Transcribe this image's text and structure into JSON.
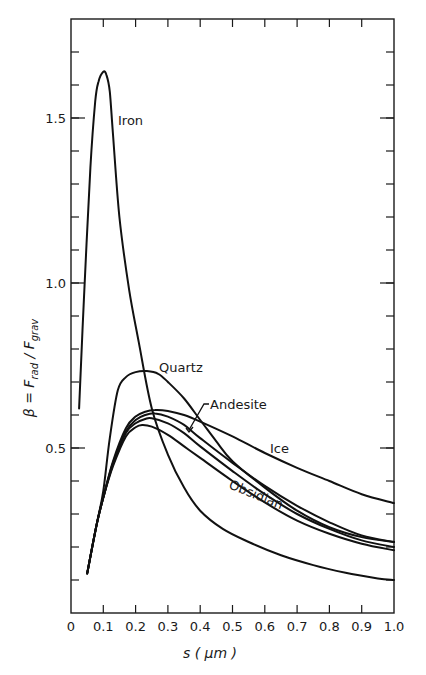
{
  "chart_data": {
    "type": "line",
    "title": "",
    "xlabel": "s (μm)",
    "ylabel": "β = F_rad / F_grav",
    "xlim": [
      0,
      1.0
    ],
    "ylim": [
      0,
      1.8
    ],
    "grid": false,
    "legend": "inline labels",
    "x_ticks": [
      "0",
      "0.1",
      "0.2",
      "0.3",
      "0.4",
      "0.5",
      "0.6",
      "0.7",
      "0.8",
      "0.9",
      "1.0"
    ],
    "y_ticks": [
      {
        "value": 0.1,
        "label": ""
      },
      {
        "value": 0.2,
        "label": ""
      },
      {
        "value": 0.3,
        "label": ""
      },
      {
        "value": 0.4,
        "label": ""
      },
      {
        "value": 0.5,
        "label": "0.5"
      },
      {
        "value": 0.6,
        "label": ""
      },
      {
        "value": 0.7,
        "label": ""
      },
      {
        "value": 0.8,
        "label": ""
      },
      {
        "value": 0.9,
        "label": ""
      },
      {
        "value": 1.0,
        "label": "1.0"
      },
      {
        "value": 1.1,
        "label": ""
      },
      {
        "value": 1.2,
        "label": ""
      },
      {
        "value": 1.3,
        "label": ""
      },
      {
        "value": 1.4,
        "label": ""
      },
      {
        "value": 1.5,
        "label": "1.5"
      },
      {
        "value": 1.6,
        "label": ""
      },
      {
        "value": 1.7,
        "label": ""
      }
    ],
    "series": [
      {
        "name": "Iron",
        "x": [
          0.025,
          0.04,
          0.06,
          0.075,
          0.085,
          0.1,
          0.11,
          0.12,
          0.13,
          0.15,
          0.18,
          0.21,
          0.25,
          0.3,
          0.35,
          0.4,
          0.47,
          0.55,
          0.65,
          0.75,
          0.85,
          0.95,
          1.0
        ],
        "y": [
          0.62,
          0.95,
          1.35,
          1.55,
          1.61,
          1.64,
          1.63,
          1.58,
          1.45,
          1.2,
          0.98,
          0.82,
          0.62,
          0.48,
          0.38,
          0.31,
          0.255,
          0.215,
          0.175,
          0.145,
          0.122,
          0.105,
          0.1
        ]
      },
      {
        "name": "Quartz",
        "x": [
          0.05,
          0.08,
          0.1,
          0.12,
          0.145,
          0.17,
          0.2,
          0.235,
          0.27,
          0.3,
          0.35,
          0.4,
          0.45,
          0.5,
          0.6,
          0.7,
          0.8,
          0.9,
          1.0
        ],
        "y": [
          0.12,
          0.27,
          0.37,
          0.53,
          0.675,
          0.715,
          0.73,
          0.733,
          0.725,
          0.7,
          0.65,
          0.585,
          0.52,
          0.46,
          0.38,
          0.31,
          0.26,
          0.23,
          0.215
        ]
      },
      {
        "name": "Ice",
        "x": [
          0.05,
          0.08,
          0.1,
          0.13,
          0.17,
          0.2,
          0.23,
          0.26,
          0.3,
          0.35,
          0.4,
          0.5,
          0.6,
          0.7,
          0.8,
          0.9,
          1.0
        ],
        "y": [
          0.12,
          0.27,
          0.35,
          0.46,
          0.56,
          0.595,
          0.61,
          0.615,
          0.612,
          0.6,
          0.58,
          0.535,
          0.485,
          0.44,
          0.4,
          0.36,
          0.333
        ]
      },
      {
        "name": "Andesite",
        "x": [
          0.05,
          0.08,
          0.1,
          0.13,
          0.17,
          0.2,
          0.23,
          0.26,
          0.3,
          0.35,
          0.4,
          0.5,
          0.6,
          0.7,
          0.8,
          0.9,
          1.0
        ],
        "y": [
          0.12,
          0.27,
          0.35,
          0.455,
          0.55,
          0.585,
          0.6,
          0.605,
          0.595,
          0.57,
          0.53,
          0.455,
          0.385,
          0.325,
          0.275,
          0.235,
          0.215
        ]
      },
      {
        "name": "(unlabeled)",
        "x": [
          0.05,
          0.08,
          0.1,
          0.13,
          0.17,
          0.2,
          0.23,
          0.25,
          0.3,
          0.35,
          0.4,
          0.5,
          0.6,
          0.7,
          0.8,
          0.9,
          1.0
        ],
        "y": [
          0.12,
          0.27,
          0.35,
          0.45,
          0.545,
          0.575,
          0.588,
          0.59,
          0.575,
          0.545,
          0.505,
          0.43,
          0.36,
          0.3,
          0.255,
          0.22,
          0.2
        ]
      },
      {
        "name": "Obsidian",
        "x": [
          0.05,
          0.08,
          0.1,
          0.13,
          0.17,
          0.2,
          0.22,
          0.25,
          0.3,
          0.35,
          0.4,
          0.5,
          0.6,
          0.7,
          0.8,
          0.9,
          1.0
        ],
        "y": [
          0.12,
          0.27,
          0.35,
          0.445,
          0.535,
          0.563,
          0.57,
          0.565,
          0.54,
          0.505,
          0.47,
          0.4,
          0.335,
          0.28,
          0.24,
          0.21,
          0.19
        ]
      }
    ],
    "annotations": [
      {
        "text": "Iron",
        "x": 0.145,
        "y": 1.5
      },
      {
        "text": "Quartz",
        "x": 0.27,
        "y": 0.76
      },
      {
        "text": "Andesite",
        "x": 0.43,
        "y": 0.63,
        "arrow_to": {
          "x": 0.365,
          "y": 0.56
        }
      },
      {
        "text": "Ice",
        "x": 0.64,
        "y": 0.5
      },
      {
        "text": "Obsidian",
        "x": 0.5,
        "y": 0.37,
        "rotation": 20
      }
    ]
  },
  "labels": {
    "x_axis": "s ( μm )",
    "y_axis_beta": "β = F",
    "y_axis_rad": "rad",
    "y_axis_slash": " / F",
    "y_axis_grav": "grav",
    "iron": "Iron",
    "quartz": "Quartz",
    "andesite": "Andesite",
    "ice": "Ice",
    "obsidian": "Obsidian"
  }
}
